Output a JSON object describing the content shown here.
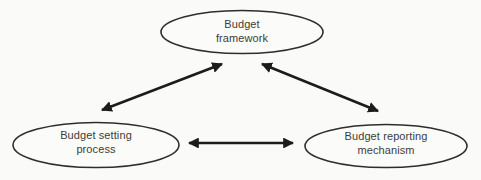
{
  "diagram": {
    "type": "relationship-diagram",
    "background_color": "#fafaf8",
    "node_stroke_color": "#2e2e2e",
    "node_fill_color": "#fbfbf9",
    "arrow_color": "#1c1c1c",
    "text_color": "#3c3c3c",
    "nodes": {
      "framework": {
        "label": "Budget framework",
        "line1": "Budget",
        "line2": "framework"
      },
      "setting": {
        "label": "Budget setting process",
        "line1": "Budget setting",
        "line2": "process"
      },
      "reporting": {
        "label": "Budget reporting mechanism",
        "line1": "Budget reporting",
        "line2": "mechanism"
      }
    },
    "edges": [
      {
        "from": "Budget framework",
        "to": "Budget setting process",
        "style": "double-headed-arrow"
      },
      {
        "from": "Budget framework",
        "to": "Budget reporting mechanism",
        "style": "double-headed-arrow"
      },
      {
        "from": "Budget setting process",
        "to": "Budget reporting mechanism",
        "style": "double-headed-arrow"
      }
    ]
  }
}
